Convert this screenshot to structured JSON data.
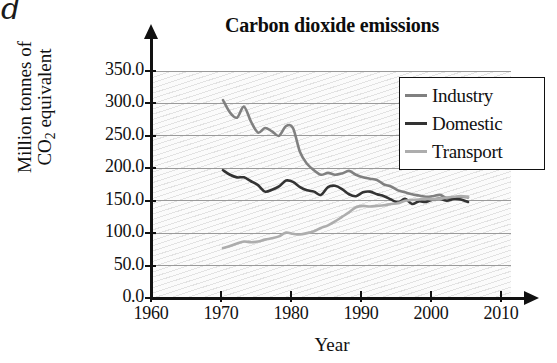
{
  "part_label": "d",
  "chart_data": {
    "type": "line",
    "title": "Carbon dioxide emissions",
    "xlabel": "Year",
    "ylabel": "Million tonnes of CO2 equivalent",
    "ylabel_line1": "Million tonnes of",
    "ylabel_line2_prefix": "CO",
    "ylabel_line2_sub": "2",
    "ylabel_line2_suffix": " equivalent",
    "grid": true,
    "legend_position": "top-right",
    "xlim": [
      1960,
      2013
    ],
    "ylim": [
      0,
      350
    ],
    "xticks": [
      1960,
      1970,
      1980,
      1990,
      2000,
      2010
    ],
    "xtick_labels": [
      "1960",
      "1970",
      "1980",
      "1990",
      "2000",
      "2010"
    ],
    "yticks": [
      0,
      50,
      100,
      150,
      200,
      250,
      300,
      350
    ],
    "ytick_labels": [
      "0.0",
      "50.0",
      "100.0",
      "150.0",
      "200.0",
      "250.0",
      "300.0",
      "350.0"
    ],
    "series": [
      {
        "name": "Industry",
        "color": "#808080",
        "x": [
          1970,
          1971,
          1972,
          1973,
          1974,
          1975,
          1976,
          1977,
          1978,
          1979,
          1980,
          1981,
          1982,
          1983,
          1984,
          1985,
          1986,
          1987,
          1988,
          1989,
          1990,
          1991,
          1992,
          1993,
          1994,
          1995,
          1996,
          1997,
          1998,
          1999,
          2000,
          2001,
          2002,
          2003,
          2004,
          2005
        ],
        "values": [
          305,
          286,
          278,
          295,
          272,
          255,
          262,
          257,
          250,
          265,
          262,
          225,
          207,
          197,
          190,
          193,
          190,
          192,
          196,
          190,
          186,
          184,
          182,
          175,
          172,
          166,
          163,
          160,
          158,
          156,
          157,
          159,
          154,
          155,
          156,
          155
        ]
      },
      {
        "name": "Domestic",
        "color": "#333333",
        "x": [
          1970,
          1971,
          1972,
          1973,
          1974,
          1975,
          1976,
          1977,
          1978,
          1979,
          1980,
          1981,
          1982,
          1983,
          1984,
          1985,
          1986,
          1987,
          1988,
          1989,
          1990,
          1991,
          1992,
          1993,
          1994,
          1995,
          1996,
          1997,
          1998,
          1999,
          2000,
          2001,
          2002,
          2003,
          2004,
          2005
        ],
        "values": [
          197,
          190,
          186,
          186,
          180,
          174,
          164,
          167,
          172,
          181,
          179,
          171,
          166,
          164,
          159,
          171,
          173,
          168,
          160,
          157,
          163,
          164,
          160,
          157,
          152,
          147,
          153,
          145,
          149,
          148,
          152,
          153,
          150,
          153,
          152,
          148
        ]
      },
      {
        "name": "Transport",
        "color": "#adadad",
        "x": [
          1970,
          1971,
          1972,
          1973,
          1974,
          1975,
          1976,
          1977,
          1978,
          1979,
          1980,
          1981,
          1982,
          1983,
          1984,
          1985,
          1986,
          1987,
          1988,
          1989,
          1990,
          1991,
          1992,
          1993,
          1994,
          1995,
          1996,
          1997,
          1998,
          1999,
          2000,
          2001,
          2002,
          2003,
          2004,
          2005
        ],
        "values": [
          77,
          80,
          84,
          87,
          86,
          87,
          90,
          92,
          95,
          101,
          99,
          98,
          100,
          103,
          108,
          112,
          118,
          125,
          132,
          140,
          142,
          141,
          142,
          143,
          145,
          146,
          150,
          151,
          152,
          153,
          152,
          153,
          155,
          156,
          157,
          156
        ]
      }
    ]
  },
  "legend": {
    "entries": [
      {
        "label": "Industry",
        "color": "#808080"
      },
      {
        "label": "Domestic",
        "color": "#333333"
      },
      {
        "label": "Transport",
        "color": "#adadad"
      }
    ]
  }
}
